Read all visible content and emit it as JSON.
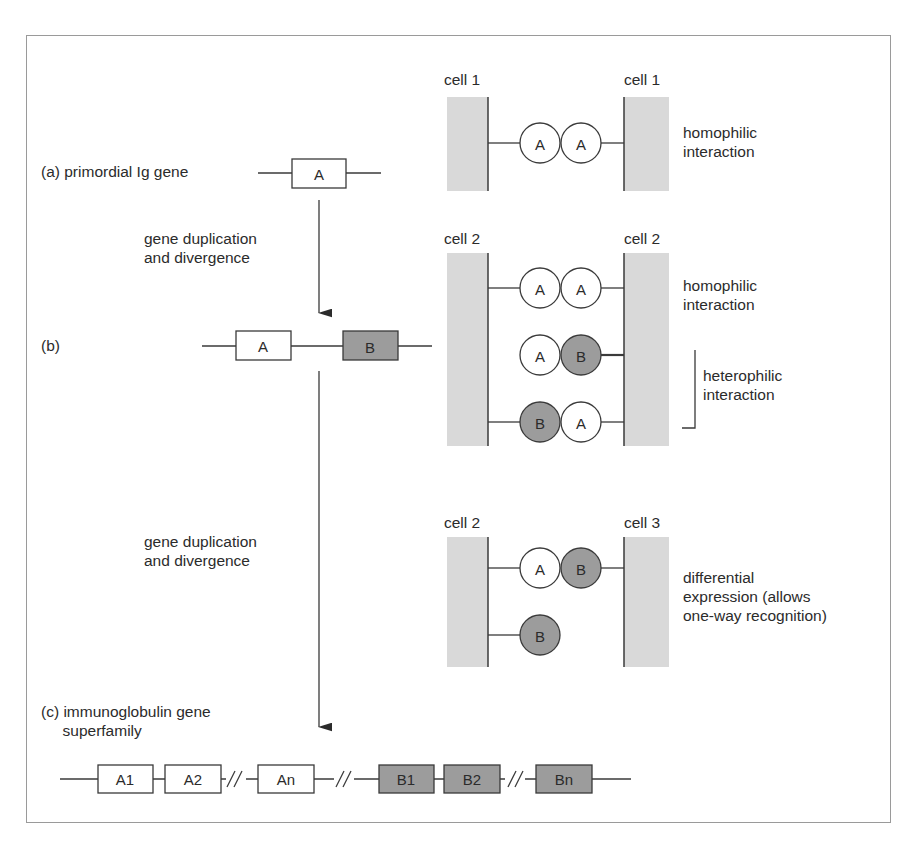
{
  "colors": {
    "cell_membrane": "#d9d9d9",
    "domain_b_fill": "#9c9c9c",
    "domain_a_fill": "#ffffff",
    "line": "#3a3a3a"
  },
  "labels": {
    "a": "(a) primordial Ig gene",
    "dup1": "gene duplication\nand divergence",
    "b": "(b)",
    "dup2": "gene duplication\nand divergence",
    "c": "(c) immunoglobulin gene\n     superfamily"
  },
  "genes": {
    "a": [
      "A"
    ],
    "b": [
      "A",
      "B"
    ],
    "c": [
      "A1",
      "A2",
      "An",
      "B1",
      "B2",
      "Bn"
    ]
  },
  "panels": [
    {
      "left_cell": "cell 1",
      "right_cell": "cell 1",
      "rows": [
        {
          "domains": [
            "A",
            "A"
          ],
          "attached": "both"
        }
      ],
      "annotations": [
        "homophilic\ninteraction"
      ]
    },
    {
      "left_cell": "cell 2",
      "right_cell": "cell 2",
      "rows": [
        {
          "domains": [
            "A",
            "A"
          ],
          "attached": "both"
        },
        {
          "domains": [
            "A",
            "B"
          ],
          "attached": "right"
        },
        {
          "domains": [
            "B",
            "A"
          ],
          "attached": "both"
        }
      ],
      "annotations": [
        "homophilic\ninteraction",
        "heterophilic\ninteraction"
      ]
    },
    {
      "left_cell": "cell 2",
      "right_cell": "cell 3",
      "rows": [
        {
          "domains": [
            "A",
            "B"
          ],
          "attached": "both"
        },
        {
          "domains": [
            "B"
          ],
          "attached": "left"
        }
      ],
      "annotations": [
        "differential\nexpression (allows\none-way recognition)"
      ]
    }
  ]
}
